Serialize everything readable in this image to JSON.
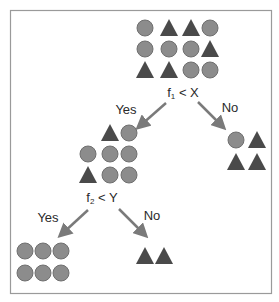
{
  "diagram": {
    "type": "decision-tree",
    "colors": {
      "circle_fill": "#8c8c8c",
      "circle_stroke": "#6f6f6f",
      "triangle_fill": "#4a4a4a",
      "arrow": "#7a7a7a",
      "frame": "#9a9a9a",
      "text": "#2a2a2a"
    },
    "nodes": {
      "root": {
        "rows": [
          [
            "circle",
            "triangle",
            "triangle",
            "circle"
          ],
          [
            "circle",
            "circle",
            "circle",
            "triangle"
          ],
          [
            "triangle",
            "triangle",
            "circle",
            "circle"
          ]
        ],
        "split": {
          "feature": "f",
          "subscript": "1",
          "op": " < ",
          "threshold": "X"
        }
      },
      "left": {
        "rows": [
          [
            null,
            "triangle",
            "circle"
          ],
          [
            "circle",
            "circle",
            "circle"
          ],
          [
            "triangle",
            "circle",
            "circle"
          ]
        ],
        "split": {
          "feature": "f",
          "subscript": "2",
          "op": " < ",
          "threshold": "Y"
        }
      },
      "right": {
        "rows": [
          [
            "circle",
            "triangle"
          ],
          [
            "triangle",
            "triangle"
          ]
        ]
      },
      "left_left": {
        "rows": [
          [
            "circle",
            "circle",
            "circle"
          ],
          [
            "circle",
            "circle",
            "circle"
          ]
        ]
      },
      "left_right": {
        "rows": [
          [
            "triangle",
            "triangle"
          ]
        ]
      }
    },
    "edges": {
      "root_yes": "Yes",
      "root_no": "No",
      "left_yes": "Yes",
      "left_no": "No"
    }
  }
}
